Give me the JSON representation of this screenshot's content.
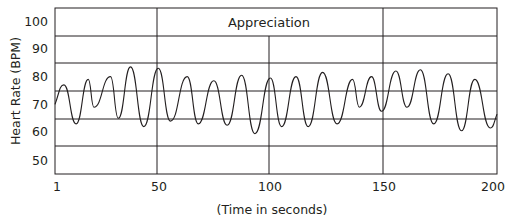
{
  "chart_data": {
    "type": "line",
    "title": "",
    "annotation": "Appreciation",
    "xlabel": "(Time in seconds)",
    "ylabel": "Heart Rate (BPM)",
    "xlim": [
      1,
      200
    ],
    "ylim": [
      45,
      105
    ],
    "x_ticks": [
      1,
      50,
      100,
      150,
      200
    ],
    "x_tick_labels": [
      "1",
      "50",
      "100",
      "150",
      "200"
    ],
    "y_ticks": [
      100,
      90,
      80,
      70,
      60,
      50
    ],
    "y_tick_labels": [
      "100",
      "90",
      "80",
      "70",
      "60",
      "50"
    ],
    "grid": true,
    "legend": null,
    "series": [
      {
        "name": "Heart Rate",
        "x": [
          1,
          5,
          10.5,
          16,
          18.5,
          26,
          29.5,
          35,
          41,
          47.5,
          53,
          60.5,
          65.5,
          72.5,
          78.5,
          85,
          91,
          98,
          103,
          109.5,
          115,
          121.5,
          128,
          135,
          138,
          143.5,
          148,
          154.5,
          159.5,
          165.5,
          171.5,
          178,
          184,
          190,
          197,
          200
        ],
        "values": [
          70,
          77,
          63,
          79,
          69,
          80,
          65,
          83.5,
          62,
          83,
          64,
          80,
          63,
          78.5,
          62.5,
          80.5,
          59.5,
          79.5,
          62,
          80,
          62,
          81.5,
          63,
          79,
          69,
          80,
          67.5,
          82,
          69,
          82.5,
          63,
          81,
          60.5,
          79,
          61.5,
          66.5
        ]
      }
    ]
  },
  "labels": {
    "annotation": "Appreciation",
    "xlabel": "(Time in seconds)",
    "ylabel": "Heart Rate (BPM)",
    "x_ticks": [
      "1",
      "50",
      "100",
      "150",
      "200"
    ],
    "y_ticks": [
      "100",
      "90",
      "80",
      "70",
      "60",
      "50"
    ]
  }
}
